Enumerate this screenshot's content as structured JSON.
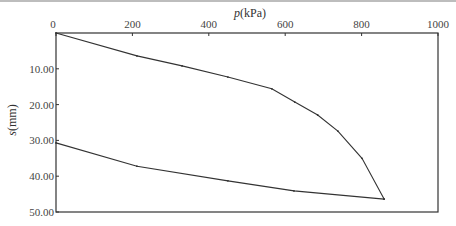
{
  "chart_data": {
    "type": "line",
    "title": "",
    "xlabel": "p(kPa)",
    "ylabel": "s(mm)",
    "x_axis_position": "top",
    "y_axis_inverted": true,
    "xlim": [
      0,
      1000
    ],
    "ylim": [
      0,
      50
    ],
    "x_ticks": [
      0,
      200,
      400,
      600,
      800,
      1000
    ],
    "x_tick_labels": [
      "0",
      "200",
      "400",
      "600",
      "800",
      "1000"
    ],
    "y_ticks": [
      10,
      20,
      30,
      40,
      50
    ],
    "y_tick_labels": [
      "10.00",
      "20.00",
      "30.00",
      "40.00",
      "50.00"
    ],
    "grid": false,
    "legend": null,
    "series": [
      {
        "name": "loading",
        "x": [
          0,
          212,
          330,
          450,
          565,
          625,
          685,
          738,
          801,
          859
        ],
        "y": [
          0,
          6.4,
          9.2,
          12.3,
          15.6,
          19.3,
          22.9,
          27.4,
          35.0,
          46.4
        ]
      },
      {
        "name": "unloading",
        "x": [
          859,
          623,
          450,
          212,
          0
        ],
        "y": [
          46.4,
          44.1,
          41.3,
          37.2,
          30.7
        ]
      }
    ]
  },
  "labels": {
    "x_title_italic": "p",
    "x_title_unit": "(kPa)",
    "y_title_italic": "s",
    "y_title_unit": "(mm)"
  },
  "style": {
    "line_color": "#333333",
    "axis_color": "#333333"
  }
}
